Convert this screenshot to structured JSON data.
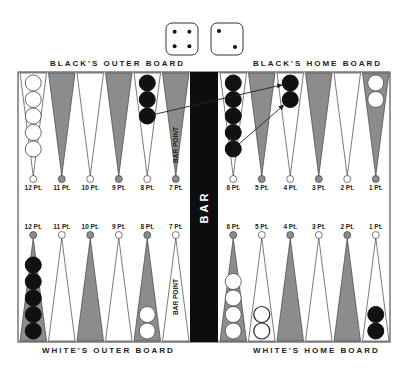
{
  "dice": [
    4,
    2
  ],
  "labels": {
    "black_outer": "BLACK'S OUTER BOARD",
    "black_home": "BLACK'S HOME BOARD",
    "white_outer": "WHITE'S OUTER BOARD",
    "white_home": "WHITE'S HOME BOARD",
    "bar": "BAR",
    "bar_point": "BAR POINT"
  },
  "colors": {
    "dark_point": "#8c8c8c",
    "light_point": "#ffffff",
    "black_checker": "#111111",
    "white_checker": "#ffffff",
    "bar": "#0d0d0d",
    "outline": "#333333"
  },
  "top_points": [
    {
      "label": "12 Pt.",
      "shade": "light",
      "checkers": {
        "color": "white",
        "count": 5
      }
    },
    {
      "label": "11 Pt.",
      "shade": "dark",
      "checkers": {
        "color": "none",
        "count": 0
      }
    },
    {
      "label": "10 Pt.",
      "shade": "light",
      "checkers": {
        "color": "none",
        "count": 0
      }
    },
    {
      "label": "9 Pt.",
      "shade": "dark",
      "checkers": {
        "color": "none",
        "count": 0
      }
    },
    {
      "label": "8 Pt.",
      "shade": "light",
      "checkers": {
        "color": "black",
        "count": 3
      }
    },
    {
      "label": "7 Pt.",
      "shade": "dark",
      "checkers": {
        "color": "none",
        "count": 0
      }
    },
    {
      "label": "6 Pt.",
      "shade": "light",
      "checkers": {
        "color": "black",
        "count": 5
      }
    },
    {
      "label": "5 Pt.",
      "shade": "dark",
      "checkers": {
        "color": "none",
        "count": 0
      }
    },
    {
      "label": "4 Pt.",
      "shade": "light",
      "checkers": {
        "color": "black",
        "count": 2
      }
    },
    {
      "label": "3 Pt.",
      "shade": "dark",
      "checkers": {
        "color": "none",
        "count": 0
      }
    },
    {
      "label": "2 Pt.",
      "shade": "light",
      "checkers": {
        "color": "none",
        "count": 0
      }
    },
    {
      "label": "1 Pt.",
      "shade": "dark",
      "checkers": {
        "color": "white",
        "count": 2
      }
    }
  ],
  "bottom_points": [
    {
      "label": "12 Pt.",
      "shade": "dark",
      "checkers": {
        "color": "black",
        "count": 5
      }
    },
    {
      "label": "11 Pt.",
      "shade": "light",
      "checkers": {
        "color": "none",
        "count": 0
      }
    },
    {
      "label": "10 Pt.",
      "shade": "dark",
      "checkers": {
        "color": "none",
        "count": 0
      }
    },
    {
      "label": "9 Pt.",
      "shade": "light",
      "checkers": {
        "color": "none",
        "count": 0
      }
    },
    {
      "label": "8 Pt.",
      "shade": "dark",
      "checkers": {
        "color": "white",
        "count": 2
      }
    },
    {
      "label": "7 Pt.",
      "shade": "light",
      "checkers": {
        "color": "none",
        "count": 0
      }
    },
    {
      "label": "6 Pt.",
      "shade": "dark",
      "checkers": {
        "color": "white",
        "count": 4
      }
    },
    {
      "label": "5 Pt.",
      "shade": "light",
      "checkers": {
        "color": "white-outline",
        "count": 2
      }
    },
    {
      "label": "4 Pt.",
      "shade": "dark",
      "checkers": {
        "color": "none",
        "count": 0
      }
    },
    {
      "label": "3 Pt.",
      "shade": "light",
      "checkers": {
        "color": "none",
        "count": 0
      }
    },
    {
      "label": "2 Pt.",
      "shade": "dark",
      "checkers": {
        "color": "none",
        "count": 0
      }
    },
    {
      "label": "1 Pt.",
      "shade": "light",
      "checkers": {
        "color": "black",
        "count": 2
      }
    }
  ],
  "moves": [
    {
      "from": "top 8 Pt. checker 3",
      "to": "top 4 Pt. checker 1"
    },
    {
      "from": "top 6 Pt. checker 5",
      "to": "top 4 Pt. checker 2"
    }
  ]
}
